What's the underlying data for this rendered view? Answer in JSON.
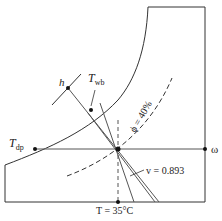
{
  "diagram": {
    "type": "psychrometric-chart-sketch",
    "labels": {
      "enthalpy": "h",
      "wet_bulb": "T",
      "wet_bulb_sub": "wb",
      "dew_point": "T",
      "dew_point_sub": "dp",
      "humidity_ratio": "ω",
      "relative_humidity": "ϕ = 40%",
      "specific_volume": "v = 0.893",
      "dry_bulb": "T = 35°C"
    },
    "colors": {
      "line": "#333333",
      "guide": "#555555"
    }
  }
}
